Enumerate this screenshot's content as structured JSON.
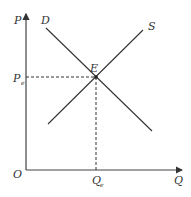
{
  "diagram": {
    "axes": {
      "y_label": "P",
      "x_label": "Q",
      "origin_label": "O"
    },
    "curves": {
      "demand_label": "D",
      "supply_label": "S"
    },
    "equilibrium": {
      "point_label": "E",
      "price_label": "P",
      "price_subscript": "e",
      "quantity_label": "Q",
      "quantity_subscript": "e"
    },
    "colors": {
      "line": "#333333",
      "background": "#ffffff"
    }
  }
}
